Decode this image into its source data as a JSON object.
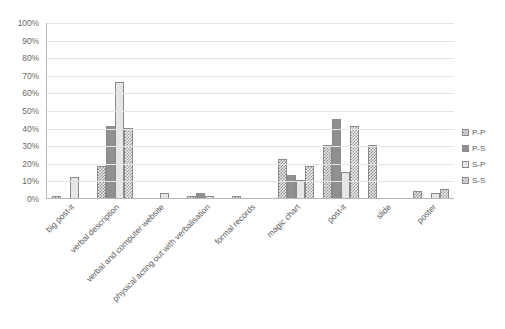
{
  "chart_data": {
    "type": "bar",
    "title": "",
    "subtitle": "",
    "xlabel": "",
    "ylabel": "",
    "ylim": [
      0,
      100
    ],
    "y_unit": "%",
    "grid": true,
    "legend_position": "right",
    "y_ticks": [
      "0%",
      "10%",
      "20%",
      "30%",
      "40%",
      "50%",
      "60%",
      "70%",
      "80%",
      "90%",
      "100%"
    ],
    "y_tick_values": [
      0,
      10,
      20,
      30,
      40,
      50,
      60,
      70,
      80,
      90,
      100
    ],
    "categories": [
      "big post-it",
      "verbal description",
      "verbal and computer website",
      "physical acting out with verbalisation",
      "formal records",
      "magic chart",
      "post-it",
      "slide",
      "poster"
    ],
    "series": [
      {
        "name": "P-P",
        "pattern": "crosshatch",
        "color": "#8d8d8d",
        "values": [
          1,
          18,
          0,
          1,
          1,
          22,
          30,
          30,
          4
        ]
      },
      {
        "name": "P-S",
        "pattern": "solid-dark",
        "color": "#909090",
        "values": [
          0,
          41,
          0,
          3,
          0,
          13,
          45,
          0,
          0
        ]
      },
      {
        "name": "S-P",
        "pattern": "light",
        "color": "#e6e6e6",
        "values": [
          12,
          66,
          3,
          1,
          0,
          10,
          15,
          0,
          3
        ]
      },
      {
        "name": "S-S",
        "pattern": "checker",
        "color": "#9a9a9a",
        "values": [
          0,
          40,
          0,
          0,
          0,
          18,
          41,
          0,
          5
        ]
      }
    ]
  },
  "legend": {
    "items": [
      {
        "label": "P-P"
      },
      {
        "label": "P-S"
      },
      {
        "label": "S-P"
      },
      {
        "label": "S-S"
      }
    ]
  }
}
